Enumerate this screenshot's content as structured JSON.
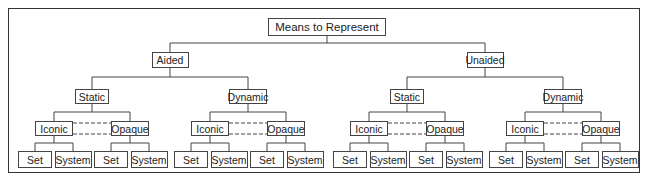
{
  "diagram": {
    "type": "tree",
    "root": "Means to Represent",
    "level1": [
      "Aided",
      "Unaided"
    ],
    "level2": [
      "Static",
      "Dynamic"
    ],
    "level3": [
      "Iconic",
      "Opaque"
    ],
    "level4": [
      "Set",
      "System"
    ],
    "connector_note": "Iconic and Opaque siblings joined by dashed lines"
  },
  "labels": {
    "root": "Means to Represent",
    "aided": "Aided",
    "unaided": "Unaided",
    "static": "Static",
    "dynamic": "Dynamic",
    "iconic": "Iconic",
    "opaque": "Opaque",
    "set": "Set",
    "system": "System"
  },
  "colors": {
    "line": "#444444",
    "background": "#ffffff"
  }
}
